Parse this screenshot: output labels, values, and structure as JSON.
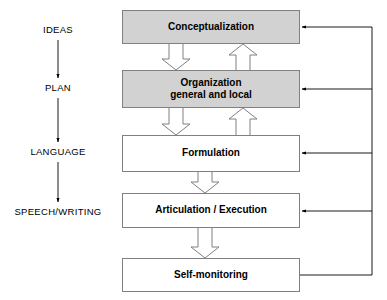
{
  "diagram": {
    "colors": {
      "shaded_fill": "#d2d2d2",
      "plain_fill": "#ffffff",
      "box_border": "#808080",
      "arrow_outline": "#808080",
      "feedback_line": "#000000",
      "text": "#000000"
    },
    "stage_labels": [
      {
        "id": "ideas",
        "text": "IDEAS",
        "cx": 58,
        "cy": 30
      },
      {
        "id": "plan",
        "text": "PLAN",
        "cx": 58,
        "cy": 88
      },
      {
        "id": "language",
        "text": "LANGUAGE",
        "cx": 58,
        "cy": 152
      },
      {
        "id": "speech-writing",
        "text": "SPEECH/WRITING",
        "cx": 58,
        "cy": 212
      }
    ],
    "stage_connectors": [
      {
        "id": "ideas-to-plan",
        "x": 58,
        "y1": 40,
        "y2": 78
      },
      {
        "id": "plan-to-language",
        "x": 58,
        "y1": 98,
        "y2": 142
      },
      {
        "id": "language-to-speech",
        "x": 58,
        "y1": 162,
        "y2": 202
      }
    ],
    "boxes": [
      {
        "id": "conceptualization",
        "lines": [
          "Conceptualization"
        ],
        "fill": "shaded",
        "x": 122,
        "y": 10,
        "w": 178,
        "h": 34
      },
      {
        "id": "organization",
        "lines": [
          "Organization",
          "general and local"
        ],
        "fill": "shaded",
        "x": 122,
        "y": 70,
        "w": 178,
        "h": 38
      },
      {
        "id": "formulation",
        "lines": [
          "Formulation"
        ],
        "fill": "plain",
        "x": 122,
        "y": 135,
        "w": 178,
        "h": 37
      },
      {
        "id": "articulation-execution",
        "lines": [
          "Articulation / Execution"
        ],
        "fill": "plain",
        "x": 122,
        "y": 193,
        "w": 178,
        "h": 35
      },
      {
        "id": "self-monitoring",
        "lines": [
          "Self-monitoring"
        ],
        "fill": "plain",
        "x": 122,
        "y": 258,
        "w": 178,
        "h": 34
      }
    ],
    "block_arrows_down": [
      {
        "id": "conceptualization-to-organization",
        "cx": 176,
        "y1": 44,
        "y2": 70
      },
      {
        "id": "organization-to-formulation",
        "cx": 176,
        "y1": 108,
        "y2": 135
      },
      {
        "id": "formulation-to-articulation",
        "cx": 205,
        "y1": 172,
        "y2": 193
      },
      {
        "id": "articulation-to-self-monitoring",
        "cx": 205,
        "y1": 228,
        "y2": 258
      }
    ],
    "block_arrows_up": [
      {
        "id": "organization-to-conceptualization",
        "cx": 243,
        "y1": 70,
        "y2": 44
      },
      {
        "id": "formulation-to-organization",
        "cx": 243,
        "y1": 135,
        "y2": 108
      }
    ],
    "feedback": {
      "bus_x": 372,
      "source_box": "self-monitoring",
      "source_y": 275,
      "arrows": [
        {
          "id": "feedback-to-conceptualization",
          "target": "conceptualization",
          "y": 27,
          "x_from": 372,
          "x_to": 302
        },
        {
          "id": "feedback-to-organization",
          "target": "organization",
          "y": 89,
          "x_from": 372,
          "x_to": 302
        },
        {
          "id": "feedback-to-formulation",
          "target": "formulation",
          "y": 153,
          "x_from": 372,
          "x_to": 302
        },
        {
          "id": "feedback-to-articulation",
          "target": "articulation-execution",
          "y": 211,
          "x_from": 372,
          "x_to": 302
        }
      ]
    }
  }
}
